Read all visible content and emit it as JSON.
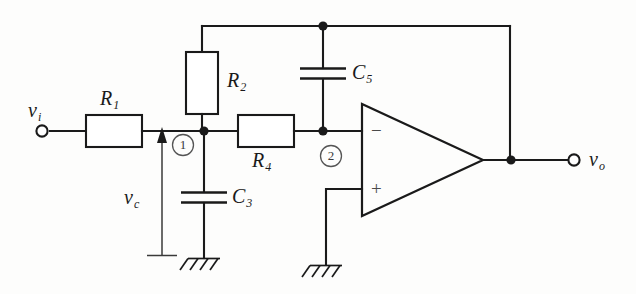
{
  "figure": {
    "kind": "schematic-diagram",
    "background_color": "#fdfdfc",
    "line_color": "#1a1a1a"
  },
  "terminals": [
    {
      "id": "input",
      "name": "input-terminal",
      "label": "v",
      "subscript": "i"
    },
    {
      "id": "output",
      "name": "output-terminal",
      "label": "v",
      "subscript": "o"
    }
  ],
  "components": [
    {
      "id": "R1",
      "type": "resistor",
      "letter": "R",
      "subscript": "1",
      "orientation": "horizontal"
    },
    {
      "id": "R2",
      "type": "resistor",
      "letter": "R",
      "subscript": "2",
      "orientation": "vertical"
    },
    {
      "id": "R4",
      "type": "resistor",
      "letter": "R",
      "subscript": "4",
      "orientation": "horizontal"
    },
    {
      "id": "C3",
      "type": "capacitor",
      "letter": "C",
      "subscript": "3",
      "orientation": "vertical"
    },
    {
      "id": "C5",
      "type": "capacitor",
      "letter": "C",
      "subscript": "5",
      "orientation": "vertical"
    }
  ],
  "nodes": [
    {
      "id": "n1",
      "label": "1",
      "name": "node-marker-1"
    },
    {
      "id": "n2",
      "label": "2",
      "name": "node-marker-2"
    }
  ],
  "voltages": [
    {
      "id": "vc",
      "label": "v",
      "subscript": "c",
      "direction": "up",
      "name": "capacitor-voltage-label"
    }
  ],
  "opamp": {
    "name": "operational-amplifier",
    "inverting_sign": "−",
    "noninverting_sign": "+"
  },
  "grounds": [
    {
      "id": "gnd_c3",
      "name": "ground-symbol-c3"
    },
    {
      "id": "gnd_opamp",
      "name": "ground-symbol-opamp"
    },
    {
      "id": "ref_vc",
      "name": "reference-bar-vc"
    }
  ]
}
